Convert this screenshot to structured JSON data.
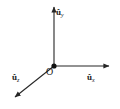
{
  "figure": {
    "background_color": "#ffffff",
    "line_color": "#262626",
    "width": 120,
    "height": 109
  },
  "origin": {
    "label": "O",
    "x": 54,
    "y": 66
  },
  "axes": [
    {
      "id": "y",
      "symbol": "û",
      "subscript": "y",
      "label": "ûy",
      "direction": "up",
      "tip_x": 54,
      "tip_y": 3
    },
    {
      "id": "x",
      "symbol": "û",
      "subscript": "x",
      "label": "ûx",
      "direction": "right",
      "tip_x": 114,
      "tip_y": 66
    },
    {
      "id": "z",
      "symbol": "û",
      "subscript": "z",
      "label": "ûz",
      "direction": "down-left",
      "tip_x": 11,
      "tip_y": 101
    }
  ]
}
